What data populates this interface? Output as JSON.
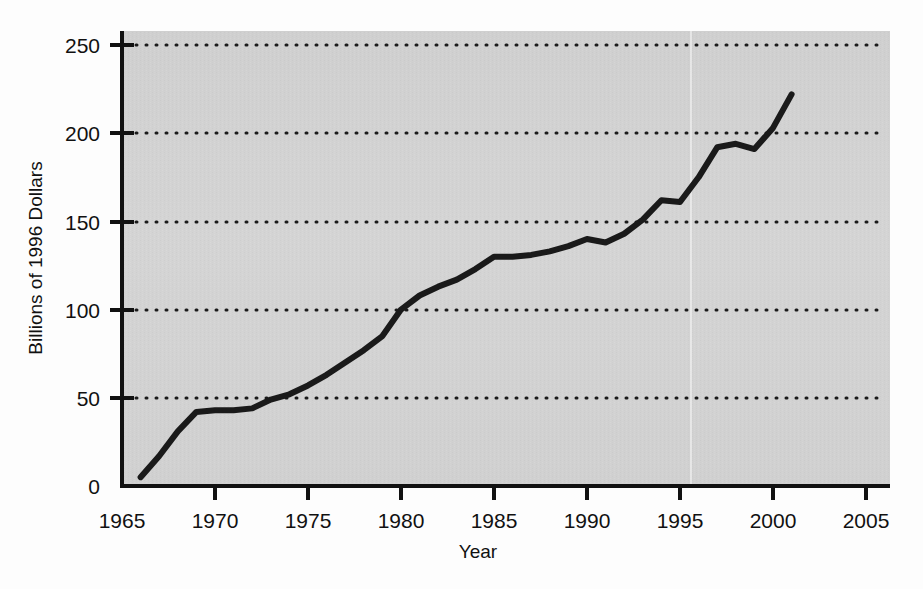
{
  "chart_data": {
    "type": "line",
    "title": "",
    "xlabel": "Year",
    "ylabel": "Billions of 1996 Dollars",
    "xlim": [
      1964.0,
      2006.3
    ],
    "ylim": [
      0,
      262
    ],
    "xticks": [
      1965,
      1970,
      1975,
      1980,
      1985,
      1990,
      1995,
      2000,
      2005
    ],
    "xtick_labels": [
      "1965",
      "1970",
      "1975",
      "1980",
      "1985",
      "1990",
      "1995",
      "2000",
      "2005"
    ],
    "yticks": [
      0,
      50,
      100,
      150,
      200,
      250
    ],
    "ytick_labels": [
      "0",
      "50",
      "100",
      "150",
      "200",
      "250"
    ],
    "grid": "horizontal-dotted",
    "gridlines": [
      50,
      100,
      150,
      200,
      250
    ],
    "legend": "none",
    "series": [
      {
        "name": "Billions of 1996 Dollars",
        "color": "#1a1a1a",
        "line_width": 6,
        "x": [
          1966,
          1967,
          1968,
          1969,
          1970,
          1971,
          1972,
          1973,
          1974,
          1975,
          1976,
          1977,
          1978,
          1979,
          1980,
          1981,
          1982,
          1983,
          1984,
          1985,
          1986,
          1987,
          1988,
          1989,
          1990,
          1991,
          1992,
          1993,
          1994,
          1995,
          1996,
          1997,
          1998,
          1999,
          2000,
          2001
        ],
        "values": [
          5,
          17,
          31,
          42,
          43,
          43,
          44,
          49,
          52,
          57,
          63,
          70,
          77,
          85,
          100,
          108,
          113,
          117,
          123,
          130,
          130,
          131,
          133,
          136,
          140,
          138,
          143,
          151,
          162,
          161,
          175,
          192,
          194,
          191,
          203,
          222
        ]
      }
    ]
  },
  "axis": {
    "y_label": "Billions of 1996 Dollars",
    "x_label": "Year",
    "color": "#111111"
  },
  "plot_area": {
    "background_color": "#d2d2d2",
    "grid_color": "#1a1a1a"
  }
}
